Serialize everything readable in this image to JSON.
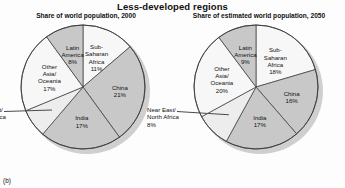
{
  "figure": {
    "title": "Less-developed regions",
    "panel_label": "(b)",
    "colors": {
      "light": "#f7f7f7",
      "midlight": "#ededed",
      "medium": "#c8c8c8",
      "medium2": "#c2c2c2",
      "outline": "#3a3a3a",
      "shadow": "#cfcfcf",
      "text": "#111111"
    }
  },
  "chart_data": [
    {
      "type": "pie",
      "title": "Share of world population, 2000",
      "panel": "left",
      "categories": [
        "Sub-Saharan Africa",
        "China",
        "India",
        "Near East/North Africa",
        "Other Asia/Oceania",
        "Latin America"
      ],
      "values": [
        11,
        21,
        17,
        6,
        17,
        8
      ],
      "labels": [
        {
          "name": "Sub-Saharan Africa",
          "text": "Sub-\nSaharan\nAfrica",
          "value": 11,
          "value_text": "11%",
          "shade": "light",
          "placement": "inside"
        },
        {
          "name": "China",
          "text": "China",
          "value": 21,
          "value_text": "21%",
          "shade": "medium",
          "placement": "inside"
        },
        {
          "name": "India",
          "text": "India",
          "value": 17,
          "value_text": "17%",
          "shade": "medium",
          "placement": "inside"
        },
        {
          "name": "Near East/North Africa",
          "text": "Near East/\nNorth Africa",
          "value": 6,
          "value_text": "6%",
          "shade": "midlight",
          "placement": "outside"
        },
        {
          "name": "Other Asia/Oceania",
          "text": "Other\nAsia/\nOceania",
          "value": 17,
          "value_text": "17%",
          "shade": "light",
          "placement": "inside"
        },
        {
          "name": "Latin America",
          "text": "Latin\nAmerica",
          "value": 8,
          "value_text": "8%",
          "shade": "medium",
          "placement": "inside"
        }
      ],
      "legend": "none",
      "grid": false
    },
    {
      "type": "pie",
      "title": "Share of estimated world population, 2050",
      "panel": "right",
      "categories": [
        "Sub-Saharan Africa",
        "China",
        "India",
        "Near East/North Africa",
        "Other Asia/Oceania",
        "Latin America"
      ],
      "values": [
        18,
        16,
        17,
        8,
        20,
        9
      ],
      "labels": [
        {
          "name": "Sub-Saharan Africa",
          "text": "Sub-\nSaharan\nAfrica",
          "value": 18,
          "value_text": "18%",
          "shade": "light",
          "placement": "inside"
        },
        {
          "name": "China",
          "text": "China",
          "value": 16,
          "value_text": "16%",
          "shade": "medium",
          "placement": "inside"
        },
        {
          "name": "India",
          "text": "India",
          "value": 17,
          "value_text": "17%",
          "shade": "medium",
          "placement": "inside"
        },
        {
          "name": "Near East/North Africa",
          "text": "Near East/\nNorth Africa",
          "value": 8,
          "value_text": "8%",
          "shade": "midlight",
          "placement": "outside"
        },
        {
          "name": "Other Asia/Oceania",
          "text": "Other\nAsia/\nOceania",
          "value": 20,
          "value_text": "20%",
          "shade": "light",
          "placement": "inside"
        },
        {
          "name": "Latin America",
          "text": "Latin\nAmerica",
          "value": 9,
          "value_text": "9%",
          "shade": "medium",
          "placement": "inside"
        }
      ],
      "legend": "none",
      "grid": false
    }
  ]
}
